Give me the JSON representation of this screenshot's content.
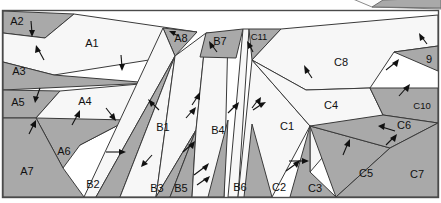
{
  "figure": {
    "name": "partition-diagram",
    "width": 441,
    "height": 203,
    "colors": {
      "dark_cell": "#a9a9a9",
      "light_cell": "#f7f7f7",
      "outline": "#3a3a3a",
      "frame": "#4a4a4a",
      "arrow": "#111111",
      "background": "#ffffff"
    },
    "groups": [
      {
        "name": "A",
        "count": 8
      },
      {
        "name": "B",
        "count": 7
      },
      {
        "name": "C",
        "count": 11
      }
    ],
    "cells": [
      {
        "id": "A1",
        "label": "A1",
        "shade": "light",
        "x": 92,
        "y": 44
      },
      {
        "id": "A2",
        "label": "A2",
        "shade": "dark",
        "x": 17,
        "y": 22
      },
      {
        "id": "A3",
        "label": "A3",
        "shade": "dark",
        "x": 19,
        "y": 72
      },
      {
        "id": "A4",
        "label": "A4",
        "shade": "light",
        "x": 85,
        "y": 102
      },
      {
        "id": "A5",
        "label": "A5",
        "shade": "dark",
        "x": 18,
        "y": 103
      },
      {
        "id": "A6",
        "label": "A6",
        "shade": "dark",
        "x": 64,
        "y": 152
      },
      {
        "id": "A7",
        "label": "A7",
        "shade": "dark",
        "x": 27,
        "y": 172
      },
      {
        "id": "A8",
        "label": "A8",
        "shade": "dark",
        "x": 181,
        "y": 39
      },
      {
        "id": "B1",
        "label": "B1",
        "shade": "light",
        "x": 163,
        "y": 128
      },
      {
        "id": "B2",
        "label": "B2",
        "shade": "dark",
        "x": 93,
        "y": 185
      },
      {
        "id": "B3",
        "label": "B3",
        "shade": "dark",
        "x": 157,
        "y": 189
      },
      {
        "id": "B4",
        "label": "B4",
        "shade": "light",
        "x": 218,
        "y": 131
      },
      {
        "id": "B5",
        "label": "B5",
        "shade": "dark",
        "x": 181,
        "y": 189
      },
      {
        "id": "B6",
        "label": "B6",
        "shade": "dark",
        "x": 240,
        "y": 188
      },
      {
        "id": "B7",
        "label": "B7",
        "shade": "dark",
        "x": 220,
        "y": 42
      },
      {
        "id": "C1",
        "label": "C1",
        "shade": "light",
        "x": 287,
        "y": 127
      },
      {
        "id": "C2",
        "label": "C2",
        "shade": "dark",
        "x": 279,
        "y": 188
      },
      {
        "id": "C3",
        "label": "C3",
        "shade": "dark",
        "x": 315,
        "y": 189
      },
      {
        "id": "C4",
        "label": "C4",
        "shade": "light",
        "x": 331,
        "y": 106
      },
      {
        "id": "C5",
        "label": "C5",
        "shade": "dark",
        "x": 366,
        "y": 174
      },
      {
        "id": "C6",
        "label": "C6",
        "shade": "dark",
        "x": 404,
        "y": 126
      },
      {
        "id": "C7",
        "label": "C7",
        "shade": "dark",
        "x": 417,
        "y": 175
      },
      {
        "id": "C8",
        "label": "C8",
        "shade": "light",
        "x": 341,
        "y": 63
      },
      {
        "id": "C9",
        "label": "9",
        "shade": "dark",
        "x": 429,
        "y": 60
      },
      {
        "id": "C10",
        "label": "C10",
        "shade": "dark",
        "x": 422,
        "y": 106
      },
      {
        "id": "C11",
        "label": "C11",
        "shade": "dark",
        "x": 259,
        "y": 37
      }
    ]
  }
}
